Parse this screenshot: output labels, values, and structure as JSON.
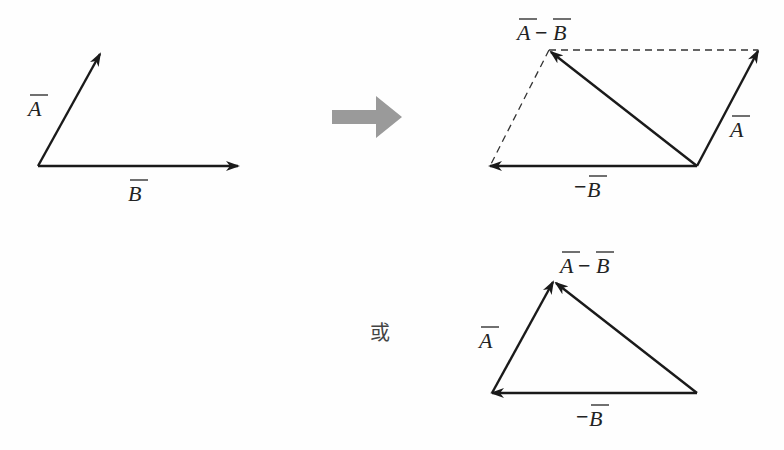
{
  "diagram": {
    "left": {
      "labels": {
        "A": "A",
        "B": "B"
      }
    },
    "transform_arrow": {
      "color": "#9a9a9a"
    },
    "parallelogram": {
      "labels": {
        "diff": "A−B",
        "diff_A": "A",
        "diff_minus": "−",
        "diff_B": "B",
        "A": "A",
        "negB_minus": "−",
        "negB": "B"
      }
    },
    "or_text": "或",
    "triangle": {
      "labels": {
        "diff_A": "A",
        "diff_minus": "−",
        "diff_B": "B",
        "A": "A",
        "negB_minus": "−",
        "negB": "B"
      }
    }
  }
}
